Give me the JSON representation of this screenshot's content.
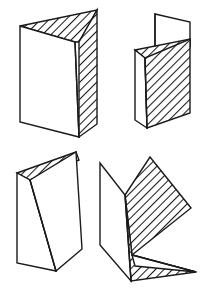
{
  "figure": {
    "background_color": "#ffffff",
    "stroke_color": "#1a1a1a",
    "hatch_color": "#1a1a1a",
    "stroke_width": 1.4,
    "hatch_angle_degrees": 45,
    "hatch_spacing": 4.2,
    "canvas": {
      "width": 210,
      "height": 291
    },
    "items": [
      {
        "id": "figure-top-left",
        "label": "Folded card, upright, wide open angle",
        "position": "top-left",
        "faces": [
          {
            "name": "top-face",
            "shaded": true,
            "points": "20,26 97,10 79,42 75,42"
          },
          {
            "name": "left-panel",
            "shaded": false,
            "points": "20,26 75,42 79,137 20,122"
          },
          {
            "name": "right-panel",
            "shaded": true,
            "points": "97,10 97,124 79,137 79,42"
          }
        ],
        "fold_edges": [
          "75,42 79,137"
        ]
      },
      {
        "id": "figure-top-right",
        "label": "Folded card, upright, narrow angle with raised flap",
        "position": "top-right",
        "faces": [
          {
            "name": "upper-flap",
            "shaded": false,
            "points": "155,14 190,22 190,46 155,46"
          },
          {
            "name": "top-face",
            "shaded": true,
            "points": "135,50 190,39 190,47 145,58"
          },
          {
            "name": "left-panel",
            "shaded": false,
            "points": "135,50 145,58 147,128 135,120"
          },
          {
            "name": "right-panel",
            "shaded": true,
            "points": "190,39 190,113 147,128 145,58"
          }
        ],
        "fold_edges": [
          "155,14 155,46",
          "145,58 147,128"
        ]
      },
      {
        "id": "figure-bottom-left",
        "label": "Folded card, upright, narrow open angle",
        "position": "bottom-left",
        "faces": [
          {
            "name": "top-face",
            "shaded": true,
            "points": "17,173 76,152 79,160 30,180"
          },
          {
            "name": "left-panel",
            "shaded": false,
            "points": "17,173 30,180 56,271 17,263"
          },
          {
            "name": "right-panel",
            "shaded": false,
            "points": "76,152 82,249 56,271 30,180"
          }
        ],
        "fold_edges": [
          "30,180 56,271"
        ]
      },
      {
        "id": "figure-bottom-right",
        "label": "Folded card, tilted and rotated, lying at an angle",
        "position": "bottom-right",
        "faces": [
          {
            "name": "upper-panel",
            "shaded": true,
            "points": "150,157 191,208 132,255 125,195"
          },
          {
            "name": "lower-panel",
            "shaded": true,
            "points": "125,195 132,255 196,272 131,281"
          },
          {
            "name": "back-panel",
            "shaded": false,
            "points": "100,163 125,195 131,281 100,245"
          },
          {
            "name": "inner-face",
            "shaded": false,
            "points": "132,255 196,272 135,266"
          }
        ],
        "fold_edges": [
          "125,195 131,281",
          "132,255 196,272"
        ]
      }
    ]
  }
}
